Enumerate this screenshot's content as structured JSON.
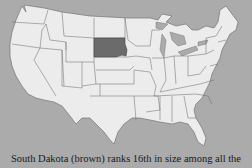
{
  "map": {
    "title": "United States map",
    "highlighted_state": "South Dakota",
    "colors": {
      "background": "#ababab",
      "land": "#ececec",
      "highlight": "#6b6b6b",
      "border": "#555555",
      "water": "#ababab"
    }
  },
  "caption": "South Dakota (brown) ranks 16th in size among all the"
}
